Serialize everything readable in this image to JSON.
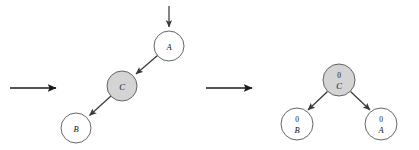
{
  "figure": {
    "background_color": "#ffffff",
    "shaded_node_color": "#d4d4d4",
    "plain_node_color": "#ffffff",
    "node_stroke_color": "#555555",
    "edge_color": "#3a3a3a",
    "transition_arrow_color": "#1a1a1a"
  },
  "panels": [
    {
      "id": "left-panel",
      "name": "before-state",
      "nodes": [
        {
          "id": "left-node-a",
          "label": "A",
          "key": "",
          "shaded": false,
          "cx": 169,
          "cy": 46,
          "r": 15
        },
        {
          "id": "left-node-c",
          "label": "C",
          "key": "",
          "shaded": true,
          "cx": 122,
          "cy": 86,
          "r": 15
        },
        {
          "id": "left-node-b",
          "label": "B",
          "key": "",
          "shaded": false,
          "cx": 76,
          "cy": 128,
          "r": 15
        }
      ],
      "edges": [
        {
          "id": "left-edge-a-c",
          "from": "A",
          "to": "C"
        },
        {
          "id": "left-edge-c-b",
          "from": "C",
          "to": "B"
        }
      ],
      "entry_arrow": {
        "id": "left-entry-arrow",
        "direction": "down",
        "target": "A"
      }
    },
    {
      "id": "right-panel",
      "name": "after-state",
      "nodes": [
        {
          "id": "right-node-c",
          "label": "C",
          "key": "0",
          "shaded": true,
          "cx": 339,
          "cy": 80,
          "r": 16
        },
        {
          "id": "right-node-b",
          "label": "B",
          "key": "0",
          "shaded": false,
          "cx": 297,
          "cy": 124,
          "r": 16
        },
        {
          "id": "right-node-a",
          "label": "A",
          "key": "0",
          "shaded": false,
          "cx": 381,
          "cy": 124,
          "r": 16
        }
      ],
      "edges": [
        {
          "id": "right-edge-c-b",
          "from": "C",
          "to": "B"
        },
        {
          "id": "right-edge-c-a",
          "from": "C",
          "to": "A"
        }
      ],
      "entry_arrow": null
    }
  ],
  "transitions": [
    {
      "id": "transition-arrow-1",
      "label": "",
      "x1": 10,
      "y1": 88,
      "x2": 60,
      "y2": 88
    },
    {
      "id": "transition-arrow-2",
      "label": "",
      "x1": 206,
      "y1": 88,
      "x2": 256,
      "y2": 88
    }
  ],
  "labels": {
    "left_a": "A",
    "left_c": "C",
    "left_b": "B",
    "right_c": "C",
    "right_b": "B",
    "right_a": "A",
    "right_c_key": "0",
    "right_b_key": "0",
    "right_a_key": "0"
  }
}
